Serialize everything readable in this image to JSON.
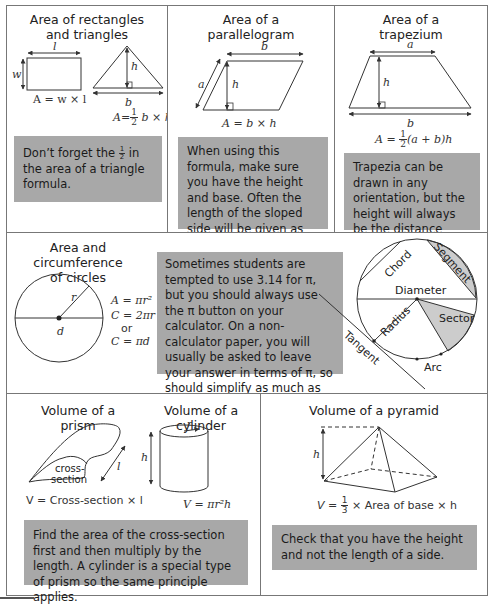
{
  "panels": {
    "rectangles": {
      "title_line1": "Area of rectangles",
      "title_line2": "and triangles",
      "labels": {
        "l": "l",
        "w": "w",
        "h": "h",
        "b": "b"
      },
      "formula_rect": "A = w × l",
      "formula_tri_prefix": "A=",
      "formula_tri_num": "1",
      "formula_tri_den": "2",
      "formula_tri_suffix": " b × h",
      "tip_part1": "Don’t forget the ",
      "tip_frac_num": "1",
      "tip_frac_den": "2",
      "tip_part2": " in the area of a triangle formula."
    },
    "parallelogram": {
      "title_line1": "Area of a",
      "title_line2": "parallelogram",
      "labels": {
        "a": "a",
        "b": "b",
        "h": "h"
      },
      "formula": "A = b × h",
      "tip": "When using this formula, make sure you have the height and base. Often the length of the sloped side will be given as well to confuse you."
    },
    "trapezium": {
      "title_line1": "Area of a",
      "title_line2": "trapezium",
      "labels": {
        "a": "a",
        "b": "b",
        "h": "h"
      },
      "formula_prefix": "A = ",
      "formula_num": "1",
      "formula_den": "2",
      "formula_suffix": "(a + b)h",
      "tip": "Trapezia can be drawn in any orientation, but the height will always be the distance between the two parallel sides."
    },
    "circles": {
      "title_line1": "Area and circumference",
      "title_line2": "of circles",
      "labels": {
        "r": "r",
        "d": "d"
      },
      "formula_area": "A = πr²",
      "formula_circ1": "C = 2πr",
      "formula_or": "or",
      "formula_circ2": "C = πd",
      "tip": "Sometimes students are tempted to use 3.14 for π, but you should always use the π button on your calculator. On a non-calculator paper, you will usually be asked to leave your answer in terms of π, so should simplify as much as possible.",
      "parts": {
        "chord": "Chord",
        "segment": "Segment",
        "diameter": "Diameter",
        "radius": "Radius",
        "sector": "Sector",
        "tangent": "Tangent",
        "arc": "Arc"
      }
    },
    "prism_cylinder": {
      "title_prism": "Volume of a prism",
      "title_cylinder": "Volume of a cylinder",
      "cross_section_label_1": "cross-",
      "cross_section_label_2": "section",
      "labels": {
        "l": "l",
        "r": "r",
        "h": "h"
      },
      "formula_prism": "V = Cross-section × l",
      "formula_cylinder": "V = πr²h",
      "tip": "Find the area of the cross-section first and then multiply by the length. A cylinder is a special type of prism so the same principle applies."
    },
    "pyramid": {
      "title": "Volume of a pyramid",
      "labels": {
        "h": "h"
      },
      "formula_prefix": "V = ",
      "formula_num": "1",
      "formula_den": "3",
      "formula_suffix": " × Area of base × h",
      "tip": "Check that you have the height and not the length of a side."
    }
  },
  "colors": {
    "tip_background": "#a8a8a8",
    "border": "#777777",
    "shaded_region": "#cccccc"
  }
}
